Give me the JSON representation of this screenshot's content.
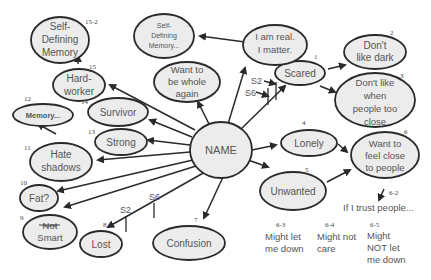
{
  "diagram": {
    "center": {
      "label": "NAME"
    },
    "nodes": [
      {
        "id": "scared",
        "number": "1",
        "lines": [
          "Scared"
        ]
      },
      {
        "id": "dont-like-dark",
        "number": "2",
        "lines": [
          "Don't",
          "like dark"
        ]
      },
      {
        "id": "dont-like-close",
        "number": "3",
        "lines": [
          "Don't like",
          "when",
          "people too",
          "close"
        ]
      },
      {
        "id": "lonely",
        "number": "4",
        "lines": [
          "Lonely"
        ]
      },
      {
        "id": "unwanted",
        "number": "5",
        "lines": [
          "Unwanted"
        ]
      },
      {
        "id": "want-close",
        "number": "6",
        "lines": [
          "Want to",
          "feel close",
          "to people"
        ]
      },
      {
        "id": "confusion",
        "number": "7",
        "lines": [
          "Confusion"
        ]
      },
      {
        "id": "lost",
        "number": "8",
        "lines": [
          "Lost"
        ]
      },
      {
        "id": "not-smart",
        "number": "9",
        "lines": [
          "Not",
          "Smart"
        ]
      },
      {
        "id": "fat",
        "number": "10",
        "lines": [
          "Fat?"
        ]
      },
      {
        "id": "hate-shadows",
        "number": "11",
        "lines": [
          "Hate",
          "shadows"
        ]
      },
      {
        "id": "memory",
        "number": "12",
        "lines": [
          "Memory..."
        ]
      },
      {
        "id": "strong",
        "number": "13",
        "lines": [
          "Strong"
        ]
      },
      {
        "id": "survivor",
        "number": "14",
        "lines": [
          "Survivor"
        ]
      },
      {
        "id": "hard-worker",
        "number": "15",
        "lines": [
          "Hard-",
          "worker"
        ]
      },
      {
        "id": "self-defining-memory",
        "number": "15-2",
        "lines": [
          "Self-",
          "Defining",
          "Memory"
        ]
      },
      {
        "id": "want-whole",
        "number": "",
        "lines": [
          "Want to",
          "be whole",
          "again"
        ]
      },
      {
        "id": "i-am-real",
        "number": "",
        "lines": [
          "I am real.",
          "I matter."
        ]
      },
      {
        "id": "self-defining-memory-2",
        "number": "",
        "lines": [
          "Self-",
          "Defining",
          "Memory..."
        ]
      }
    ],
    "free_text": [
      {
        "id": "if-i-trust",
        "number": "6-2",
        "lines": [
          "If I trust people..."
        ]
      },
      {
        "id": "might-let-down",
        "number": "6-3",
        "lines": [
          "Might let",
          "me down"
        ]
      },
      {
        "id": "might-not-care",
        "number": "6-4",
        "lines": [
          "Might not",
          "care"
        ]
      },
      {
        "id": "might-not-let-down",
        "number": "6-5",
        "lines": [
          "Might",
          "NOT let",
          "me down"
        ]
      }
    ],
    "session_marks": {
      "scared_s2": "S2",
      "scared_s6": "S6",
      "lost_s2": "S2",
      "lost_s6": "S6"
    }
  }
}
